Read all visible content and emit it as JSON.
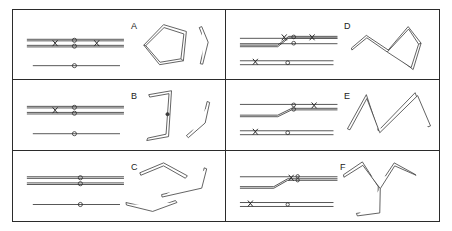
{
  "figure": {
    "background_color": "#ffffff",
    "line_color": "#2b2b2b",
    "tube_color": "#3a3a3a",
    "width": 452,
    "height": 231,
    "columns": 2,
    "rows": 3
  },
  "panels": [
    {
      "id": "A",
      "label": "A",
      "label_x": 118,
      "label_y": 12,
      "column": 1,
      "row": 1,
      "schematic": {
        "description": "Two parallel straight upper rails with a pair of stacked circle nodes at center and two cross marks; one straight lower rail with a single circle node",
        "upper_rail_count": 2,
        "lower_rail_count": 1,
        "switch": "none",
        "nodes": [
          {
            "type": "circle",
            "x": 78,
            "y": 31
          },
          {
            "type": "circle",
            "x": 78,
            "y": 37
          },
          {
            "type": "circle",
            "x": 78,
            "y": 63
          },
          {
            "type": "cross",
            "x": 54,
            "y": 34
          },
          {
            "type": "cross",
            "x": 98,
            "y": 34
          }
        ]
      },
      "shapes": [
        {
          "name": "closed-triangle-loop",
          "kind": "tube"
        },
        {
          "name": "bent-rod",
          "kind": "tube"
        }
      ]
    },
    {
      "id": "B",
      "label": "B",
      "label_x": 118,
      "label_y": 12,
      "column": 1,
      "row": 2,
      "schematic": {
        "description": "Two parallel straight upper rails with stacked circle nodes and one cross mark; one straight lower rail with a single circle node",
        "upper_rail_count": 2,
        "lower_rail_count": 1,
        "switch": "none",
        "nodes": [
          {
            "type": "circle",
            "x": 78,
            "y": 31
          },
          {
            "type": "circle",
            "x": 78,
            "y": 37
          },
          {
            "type": "circle",
            "x": 78,
            "y": 63
          },
          {
            "type": "cross",
            "x": 54,
            "y": 34
          }
        ]
      },
      "shapes": [
        {
          "name": "bracket-hook-rod",
          "kind": "tube"
        },
        {
          "name": "v-bent-rod",
          "kind": "tube"
        }
      ]
    },
    {
      "id": "C",
      "label": "C",
      "label_x": 118,
      "label_y": 12,
      "column": 1,
      "row": 3,
      "schematic": {
        "description": "Two parallel straight upper rails with stacked circle nodes only, no cross marks; one straight lower rail with a single circle node",
        "upper_rail_count": 2,
        "lower_rail_count": 1,
        "switch": "none",
        "nodes": [
          {
            "type": "circle",
            "x": 78,
            "y": 31
          },
          {
            "type": "circle",
            "x": 78,
            "y": 37
          },
          {
            "type": "circle",
            "x": 78,
            "y": 63
          }
        ]
      },
      "shapes": [
        {
          "name": "shallow-bent-rod-upper",
          "kind": "tube"
        },
        {
          "name": "hook-bent-rod-right",
          "kind": "tube"
        },
        {
          "name": "shallow-bent-rod-lower",
          "kind": "tube"
        }
      ]
    },
    {
      "id": "D",
      "label": "D",
      "label_x": 118,
      "label_y": 12,
      "column": 2,
      "row": 1,
      "schematic": {
        "description": "Upper rails joined by a diagonal switch rising from the lower rail, stacked circle nodes, two crosses on the upper rail and one cross on the lower rail",
        "upper_rail_count": 2,
        "lower_rail_count": 1,
        "switch": "diagonal-rising",
        "nodes": [
          {
            "type": "circle",
            "x": 78,
            "y": 31
          },
          {
            "type": "circle",
            "x": 78,
            "y": 37
          },
          {
            "type": "circle",
            "x": 78,
            "y": 63
          },
          {
            "type": "cross",
            "x": 68,
            "y": 32
          },
          {
            "type": "cross",
            "x": 98,
            "y": 33
          },
          {
            "type": "cross",
            "x": 38,
            "y": 60
          }
        ]
      },
      "shapes": [
        {
          "name": "teardrop-loop-with-tail",
          "kind": "tube"
        }
      ]
    },
    {
      "id": "E",
      "label": "E",
      "label_x": 118,
      "label_y": 12,
      "column": 2,
      "row": 2,
      "schematic": {
        "description": "Upper rails joined by a diagonal switch, stacked circle nodes, one cross on the upper rail and one cross on the lower rail",
        "upper_rail_count": 2,
        "lower_rail_count": 1,
        "switch": "diagonal-rising",
        "nodes": [
          {
            "type": "circle",
            "x": 78,
            "y": 29
          },
          {
            "type": "circle",
            "x": 78,
            "y": 37
          },
          {
            "type": "circle",
            "x": 78,
            "y": 63
          },
          {
            "type": "cross",
            "x": 100,
            "y": 32
          },
          {
            "type": "cross",
            "x": 38,
            "y": 60
          }
        ]
      },
      "shapes": [
        {
          "name": "zigzag-w-rod",
          "kind": "tube"
        }
      ]
    },
    {
      "id": "F",
      "label": "F",
      "label_x": 114,
      "label_y": 12,
      "column": 2,
      "row": 3,
      "schematic": {
        "description": "Upper rails joined by a diagonal switch, stacked circle nodes with one cross beside them, and one cross on the lower rail",
        "upper_rail_count": 2,
        "lower_rail_count": 1,
        "switch": "diagonal-rising",
        "nodes": [
          {
            "type": "circle",
            "x": 81,
            "y": 29
          },
          {
            "type": "circle",
            "x": 81,
            "y": 36
          },
          {
            "type": "circle",
            "x": 78,
            "y": 63
          },
          {
            "type": "cross",
            "x": 72,
            "y": 32
          },
          {
            "type": "cross",
            "x": 34,
            "y": 60
          }
        ]
      },
      "shapes": [
        {
          "name": "y-fork-with-hooked-stem",
          "kind": "tube"
        }
      ]
    }
  ]
}
